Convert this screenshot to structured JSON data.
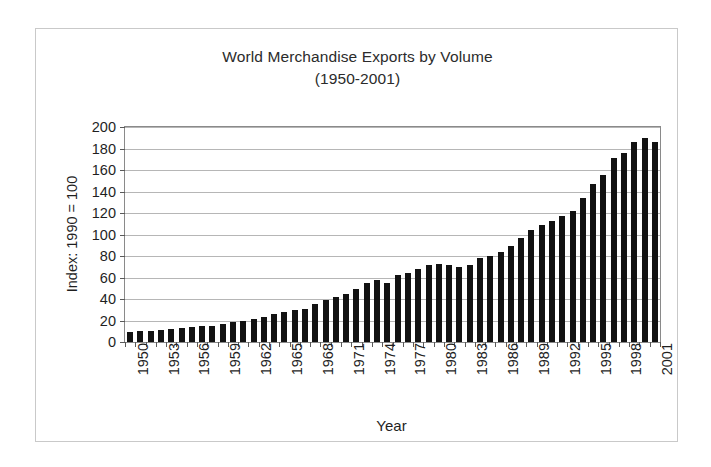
{
  "chart_data": {
    "type": "bar",
    "title": "World Merchandise Exports by Volume",
    "subtitle": "(1950-2001)",
    "xlabel": "Year",
    "ylabel": "Index: 1990 = 100",
    "ylim": [
      0,
      200
    ],
    "ytick_step": 20,
    "yticks": [
      0,
      20,
      40,
      60,
      80,
      100,
      120,
      140,
      160,
      180,
      200
    ],
    "ytick_labels": [
      "0",
      "20",
      "40",
      "60",
      "80",
      "100",
      "120",
      "140",
      "160",
      "180",
      "200"
    ],
    "grid": true,
    "legend": false,
    "bar_color": "#121212",
    "xtick_labels": [
      "1950",
      "1953",
      "1956",
      "1959",
      "1962",
      "1965",
      "1968",
      "1971",
      "1974",
      "1977",
      "1980",
      "1983",
      "1986",
      "1989",
      "1992",
      "1995",
      "1998",
      "2001"
    ],
    "xtick_interval": 3,
    "categories": [
      "1950",
      "1951",
      "1952",
      "1953",
      "1954",
      "1955",
      "1956",
      "1957",
      "1958",
      "1959",
      "1960",
      "1961",
      "1962",
      "1963",
      "1964",
      "1965",
      "1966",
      "1967",
      "1968",
      "1969",
      "1970",
      "1971",
      "1972",
      "1973",
      "1974",
      "1975",
      "1976",
      "1977",
      "1978",
      "1979",
      "1980",
      "1981",
      "1982",
      "1983",
      "1984",
      "1985",
      "1986",
      "1987",
      "1988",
      "1989",
      "1990",
      "1991",
      "1992",
      "1993",
      "1994",
      "1995",
      "1996",
      "1997",
      "1998",
      "1999",
      "2000",
      "2001"
    ],
    "values": [
      9,
      10,
      10,
      11,
      12,
      13,
      14,
      15,
      15,
      17,
      19,
      20,
      21,
      23,
      26,
      28,
      30,
      31,
      35,
      39,
      42,
      45,
      49,
      55,
      58,
      55,
      62,
      64,
      68,
      72,
      73,
      72,
      70,
      72,
      78,
      80,
      84,
      89,
      97,
      104,
      109,
      113,
      117,
      122,
      134,
      147,
      155,
      171,
      176,
      186,
      190,
      186
    ]
  }
}
